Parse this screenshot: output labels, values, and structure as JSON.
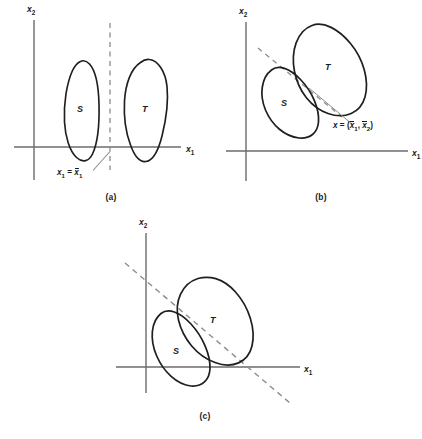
{
  "figure": {
    "type": "geometric-diagram",
    "background_color": "#ffffff",
    "stroke_colors": {
      "blob_outline": "#1f1f1f",
      "axis": "#6b6b6b",
      "dashed_line": "#8c8c8c",
      "leader_line": "#8c8c8c",
      "text": "#1b1b1b"
    }
  },
  "panels": [
    {
      "id": "a",
      "caption": "(a)",
      "x_axis_label": "x",
      "x_axis_sub": "1",
      "y_axis_label": "x",
      "y_axis_sub": "2",
      "regions": [
        {
          "label": "S",
          "position": "left-of-boundary"
        },
        {
          "label": "T",
          "position": "right-of-boundary"
        }
      ],
      "boundary": {
        "style": "dashed",
        "orientation": "vertical"
      },
      "annotation": {
        "prefix": "x",
        "prefix_sub": "1",
        "operator": " = ",
        "value": "x",
        "value_sub": "1",
        "value_has_overbar": true,
        "full_text": "x1 = x̄1"
      }
    },
    {
      "id": "b",
      "caption": "(b)",
      "x_axis_label": "x",
      "x_axis_sub": "1",
      "y_axis_label": "x",
      "y_axis_sub": "2",
      "regions": [
        {
          "label": "S",
          "position": "lower-left"
        },
        {
          "label": "T",
          "position": "upper-right"
        }
      ],
      "boundary": {
        "style": "dashed",
        "orientation": "oblique-through-tangency"
      },
      "annotation": {
        "prefix": "x",
        "operator": " = (",
        "value1": "x",
        "value1_sub": "1",
        "separator": ", ",
        "value2": "x",
        "value2_sub": "2",
        "suffix": ")",
        "value_has_overbar": true,
        "full_text": "x = (x̄1, x̄2)"
      }
    },
    {
      "id": "c",
      "caption": "(c)",
      "x_axis_label": "x",
      "x_axis_sub": "1",
      "y_axis_label": "x",
      "y_axis_sub": "2",
      "regions": [
        {
          "label": "S",
          "position": "lower-left-overlapping"
        },
        {
          "label": "T",
          "position": "upper-right-overlapping"
        }
      ],
      "boundary": {
        "style": "dashed",
        "orientation": "oblique-negative-slope"
      },
      "annotation": null
    }
  ]
}
